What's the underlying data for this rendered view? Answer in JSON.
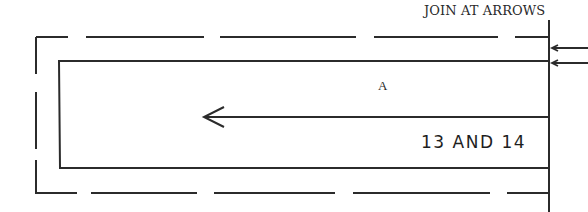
{
  "diagram": {
    "instruction": "JOIN AT ARROWS",
    "section_label": "A",
    "piece_label": "13 AND 14",
    "colors": {
      "line": "#2b2b2b",
      "background": "#ffffff"
    }
  }
}
